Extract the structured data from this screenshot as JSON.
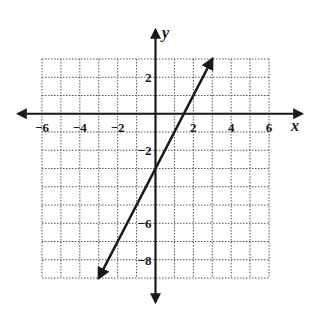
{
  "chart_data": {
    "type": "line",
    "title": "",
    "xlabel": "x",
    "ylabel": "y",
    "xlim": [
      -6,
      6
    ],
    "ylim": [
      -9,
      3
    ],
    "grid": true,
    "grid_style": "dotted",
    "x_ticks": [
      -6,
      -4,
      -2,
      2,
      4,
      6
    ],
    "y_ticks": [
      2,
      -2,
      -6,
      -8
    ],
    "x_tick_labels": [
      "−6",
      "−4",
      "−2",
      "2",
      "4",
      "6"
    ],
    "y_tick_labels": [
      "2",
      "−2",
      "−6",
      "−8"
    ],
    "series": [
      {
        "name": "y = 2x - 3",
        "equation": "y = 2x - 3",
        "slope": 2,
        "y_intercept": -3,
        "x_intercept": 1.5,
        "points": [
          [
            -3,
            -9
          ],
          [
            0,
            -3
          ],
          [
            1.5,
            0
          ],
          [
            3,
            3
          ]
        ],
        "arrows_both_ends": true
      }
    ]
  },
  "colors": {
    "ink": "#1a1a1a",
    "grid": "#555555",
    "background": "#ffffff"
  }
}
